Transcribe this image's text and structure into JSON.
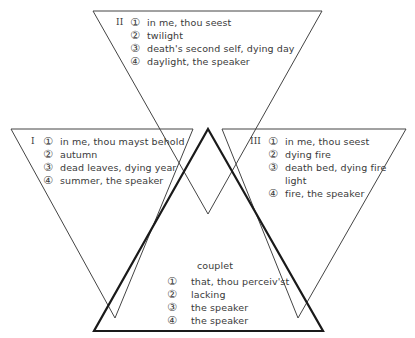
{
  "colors": {
    "line": "#3a3a3a",
    "bold_line": "#1a1a1a",
    "text": "#3a3a3a"
  },
  "quatrains": [
    {
      "roman": "II",
      "items": [
        {
          "num": "①",
          "text": "in me, thou seest"
        },
        {
          "num": "②",
          "text": "twilight"
        },
        {
          "num": "③",
          "text": "death's second self, dying day"
        },
        {
          "num": "④",
          "text": "daylight, the speaker"
        }
      ]
    },
    {
      "roman": "I",
      "items": [
        {
          "num": "①",
          "text": "in me, thou mayst behold"
        },
        {
          "num": "②",
          "text": "autumn"
        },
        {
          "num": "③",
          "text": "dead leaves, dying year"
        },
        {
          "num": "④",
          "text": "summer, the speaker"
        }
      ]
    },
    {
      "roman": "III",
      "items": [
        {
          "num": "①",
          "text": "in me, thou seest"
        },
        {
          "num": "②",
          "text": "dying fire"
        },
        {
          "num": "③",
          "text": "death bed, dying fire",
          "cont": "light"
        },
        {
          "num": "④",
          "text": "fire, the speaker"
        }
      ]
    }
  ],
  "couplet": {
    "title": "couplet",
    "items": [
      {
        "num": "①",
        "text": "that, thou perceiv'st"
      },
      {
        "num": "②",
        "text": "lacking"
      },
      {
        "num": "③",
        "text": "the speaker"
      },
      {
        "num": "④",
        "text": "the speaker"
      }
    ]
  }
}
